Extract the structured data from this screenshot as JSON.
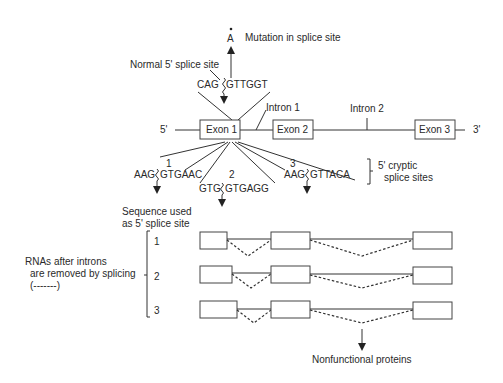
{
  "mutation": {
    "base": "A",
    "label": "Mutation in splice site"
  },
  "normal_site": {
    "label": "Normal 5' splice site",
    "seq_left": "CAG",
    "seq_right": "GTTGGT"
  },
  "gene": {
    "five_prime": "5'",
    "three_prime": "3'",
    "exons": [
      "Exon 1",
      "Exon 2",
      "Exon 3"
    ],
    "introns": [
      "Intron 1",
      "Intron 2"
    ]
  },
  "cryptic_sites": {
    "label_line1": "5' cryptic",
    "label_line2": "splice sites",
    "sites": [
      {
        "num": "1",
        "left": "AAG",
        "right": "GTGAAC"
      },
      {
        "num": "2",
        "left": "GTG",
        "right": "GTGAGG"
      },
      {
        "num": "3",
        "left": "AAG",
        "right": "GTTACA"
      }
    ]
  },
  "rnas": {
    "header_line1": "Sequence used",
    "header_line2": "as 5' splice site",
    "rows": [
      "1",
      "2",
      "3"
    ],
    "side_label_line1": "RNAs after introns",
    "side_label_line2": "are removed by splicing",
    "side_label_line3": "(-------)"
  },
  "result": "Nonfunctional proteins"
}
